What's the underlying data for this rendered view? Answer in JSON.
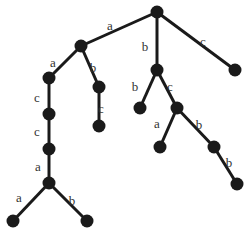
{
  "diagram": {
    "type": "tree",
    "colors": {
      "edge": "#1a1a1a",
      "node": "#1a1a1a",
      "label": "#333333",
      "background": "#ffffff"
    },
    "nodes": [
      {
        "id": "n0",
        "x": 157,
        "y": 12
      },
      {
        "id": "n1",
        "x": 81,
        "y": 46
      },
      {
        "id": "n2",
        "x": 157,
        "y": 70
      },
      {
        "id": "n3",
        "x": 235,
        "y": 70
      },
      {
        "id": "n4",
        "x": 49,
        "y": 78
      },
      {
        "id": "n5",
        "x": 99,
        "y": 87
      },
      {
        "id": "n6",
        "x": 140,
        "y": 108
      },
      {
        "id": "n7",
        "x": 177,
        "y": 108
      },
      {
        "id": "n8",
        "x": 49,
        "y": 114
      },
      {
        "id": "n9",
        "x": 99,
        "y": 126
      },
      {
        "id": "n10",
        "x": 160,
        "y": 147
      },
      {
        "id": "n11",
        "x": 214,
        "y": 147
      },
      {
        "id": "n12",
        "x": 49,
        "y": 149
      },
      {
        "id": "n13",
        "x": 49,
        "y": 183
      },
      {
        "id": "n14",
        "x": 237,
        "y": 184
      },
      {
        "id": "n15",
        "x": 13,
        "y": 221
      },
      {
        "id": "n16",
        "x": 87,
        "y": 221
      }
    ],
    "edges": [
      {
        "from": "n0",
        "to": "n1",
        "label": "a",
        "lx": 110,
        "ly": 27
      },
      {
        "from": "n0",
        "to": "n2",
        "label": "b",
        "lx": 145,
        "ly": 48
      },
      {
        "from": "n0",
        "to": "n3",
        "label": "c",
        "lx": 203,
        "ly": 43
      },
      {
        "from": "n1",
        "to": "n4",
        "label": "a",
        "lx": 53,
        "ly": 64
      },
      {
        "from": "n1",
        "to": "n5",
        "label": "b",
        "lx": 93,
        "ly": 69
      },
      {
        "from": "n4",
        "to": "n8",
        "label": "c",
        "lx": 37,
        "ly": 99
      },
      {
        "from": "n5",
        "to": "n9",
        "label": "c",
        "lx": 101,
        "ly": 110
      },
      {
        "from": "n8",
        "to": "n12",
        "label": "c",
        "lx": 37,
        "ly": 133
      },
      {
        "from": "n12",
        "to": "n13",
        "label": "a",
        "lx": 38,
        "ly": 168
      },
      {
        "from": "n13",
        "to": "n15",
        "label": "a",
        "lx": 19,
        "ly": 199
      },
      {
        "from": "n13",
        "to": "n16",
        "label": "b",
        "lx": 72,
        "ly": 202
      },
      {
        "from": "n2",
        "to": "n6",
        "label": "b",
        "lx": 135,
        "ly": 88
      },
      {
        "from": "n2",
        "to": "n7",
        "label": "c",
        "lx": 170,
        "ly": 88
      },
      {
        "from": "n7",
        "to": "n10",
        "label": "a",
        "lx": 157,
        "ly": 125
      },
      {
        "from": "n7",
        "to": "n11",
        "label": "b",
        "lx": 199,
        "ly": 126
      },
      {
        "from": "n11",
        "to": "n14",
        "label": "b",
        "lx": 229,
        "ly": 164
      }
    ]
  }
}
